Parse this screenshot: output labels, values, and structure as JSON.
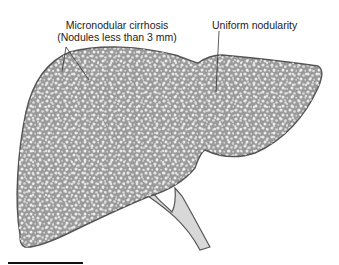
{
  "figure": {
    "labels": {
      "micronodular_line1": "Micronodular cirrhosis",
      "micronodular_line2": "(Nodules less than 3 mm)",
      "uniform": "Uniform nodularity"
    },
    "colors": {
      "liver_fill": "#9a9a9a",
      "liver_outline": "#555555",
      "nodule": "#e6e6e6",
      "vessel_fill": "#d8d8d8",
      "vessel_outline": "#555555",
      "leader_line": "#333333",
      "scale_bar": "#111111"
    }
  }
}
